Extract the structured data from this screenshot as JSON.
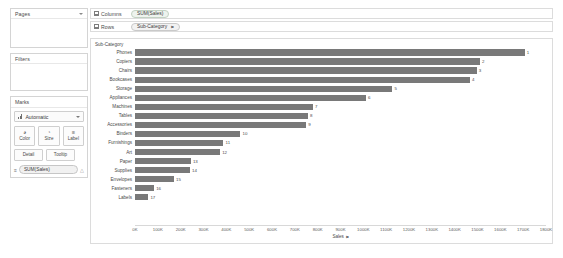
{
  "sidebar": {
    "pages": {
      "title": "Pages",
      "caret_icon": "chevron-down-icon"
    },
    "filters": {
      "title": "Filters"
    },
    "marks": {
      "title": "Marks",
      "mark_type": "Automatic",
      "buttons": [
        {
          "label": "Color",
          "icon": "color-palette-icon",
          "glyph": "◕"
        },
        {
          "label": "Size",
          "icon": "size-icon",
          "glyph": "◔"
        },
        {
          "label": "Label",
          "icon": "label-icon",
          "glyph": "≡"
        }
      ],
      "buttons2": [
        {
          "label": "Detail",
          "icon": "detail-icon"
        },
        {
          "label": "Tooltip",
          "icon": "tooltip-icon"
        }
      ],
      "measure_pill": "SUM(Sales)",
      "measure_icon": "text-mark-icon",
      "warning_icon": "warning-icon"
    }
  },
  "shelves": {
    "columns": {
      "label": "Columns",
      "icon": "columns-grid-icon",
      "field": "SUM(Sales)"
    },
    "rows": {
      "label": "Rows",
      "icon": "rows-grid-icon",
      "field": "Sub-Category",
      "sort_icon": "sort-descending-icon",
      "sort_glyph": "⫢"
    }
  },
  "viz": {
    "row_header_title": "Sub-Category",
    "axis_title": "Sales",
    "axis_sort_icon": "sort-descending-icon",
    "axis_sort_glyph": "⫢",
    "bar_color": "#797979"
  },
  "chart_data": {
    "type": "bar",
    "orientation": "horizontal",
    "title": "",
    "xlabel": "Sales",
    "ylabel": "Sub-Category",
    "xlim": [
      0,
      1800000
    ],
    "grid": false,
    "legend": "none",
    "tick_labels": [
      "0K",
      "100K",
      "200K",
      "300K",
      "400K",
      "500K",
      "600K",
      "700K",
      "800K",
      "900K",
      "1000K",
      "1100K",
      "1200K",
      "1300K",
      "1400K",
      "1500K",
      "1600K",
      "1700K",
      "1800K"
    ],
    "tick_values": [
      0,
      100000,
      200000,
      300000,
      400000,
      500000,
      600000,
      700000,
      800000,
      900000,
      1000000,
      1100000,
      1200000,
      1300000,
      1400000,
      1500000,
      1600000,
      1700000,
      1800000
    ],
    "categories": [
      "Phones",
      "Copiers",
      "Chairs",
      "Bookcases",
      "Storage",
      "Appliances",
      "Machines",
      "Tables",
      "Accessories",
      "Binders",
      "Furnishings",
      "Art",
      "Paper",
      "Supplies",
      "Envelopes",
      "Fasteners",
      "Labels"
    ],
    "values": [
      1706000,
      1510000,
      1496000,
      1466000,
      1127000,
      1011000,
      779000,
      757000,
      749000,
      461000,
      387000,
      372000,
      244000,
      240000,
      170000,
      83000,
      58000
    ],
    "data_labels": [
      "1",
      "2",
      "3",
      "4",
      "5",
      "6",
      "7",
      "8",
      "9",
      "10",
      "11",
      "12",
      "13",
      "14",
      "15",
      "16",
      "17"
    ]
  }
}
